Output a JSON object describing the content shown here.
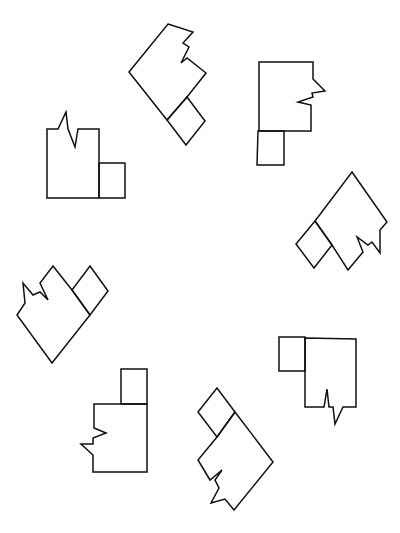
{
  "figure": {
    "stroke_color": "#111111",
    "background": "#ffffff",
    "shapes": [
      {
        "id": 1,
        "position": "top",
        "orientation": "rotated ~45deg, small square at bottom-right"
      },
      {
        "id": 2,
        "position": "top-right",
        "orientation": "upright, notch on right edge, small square below-left"
      },
      {
        "id": 3,
        "position": "upper-left",
        "orientation": "upright, notch on top edge, small square at bottom-right"
      },
      {
        "id": 4,
        "position": "right",
        "orientation": "rotated ~45deg, small square at left"
      },
      {
        "id": 5,
        "position": "left",
        "orientation": "rotated ~45deg, small square at top-right"
      },
      {
        "id": 6,
        "position": "lower-right",
        "orientation": "upright, notch on bottom edge, small square at top-left"
      },
      {
        "id": 7,
        "position": "bottom-left",
        "orientation": "upright, notch on left edge, small square on top-right"
      },
      {
        "id": 8,
        "position": "bottom",
        "orientation": "rotated ~45deg, small square at top-left"
      }
    ]
  }
}
